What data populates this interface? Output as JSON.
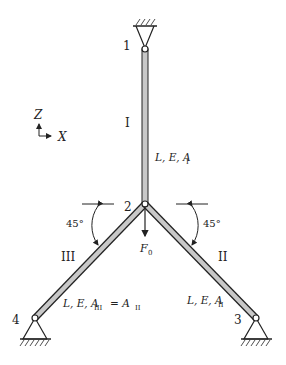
{
  "diagram": {
    "type": "truss-structure",
    "axes": {
      "z_label": "Z",
      "x_label": "X"
    },
    "nodes": [
      {
        "id": "1",
        "label": "1",
        "support": "pin-fixed-top"
      },
      {
        "id": "2",
        "label": "2",
        "support": "free"
      },
      {
        "id": "3",
        "label": "3",
        "support": "pin-fixed-bottom"
      },
      {
        "id": "4",
        "label": "4",
        "support": "pin-fixed-bottom"
      }
    ],
    "members": [
      {
        "id": "I",
        "label": "I",
        "from": "1",
        "to": "2",
        "props": "L, E, A",
        "sub": "I"
      },
      {
        "id": "II",
        "label": "II",
        "from": "2",
        "to": "3",
        "props": "L, E, A",
        "sub": "II"
      },
      {
        "id": "III",
        "label": "III",
        "from": "2",
        "to": "4",
        "props": "L, E, A",
        "sub": "III",
        "eq": "= A",
        "eq_sub": "II"
      }
    ],
    "angles": [
      {
        "label": "45°",
        "side": "left"
      },
      {
        "label": "45°",
        "side": "right"
      }
    ],
    "load": {
      "label": "F",
      "sub": "0",
      "direction": "down",
      "node": "2"
    },
    "colors": {
      "line": "#222222",
      "bar_fill": "#c8c8c8"
    }
  }
}
